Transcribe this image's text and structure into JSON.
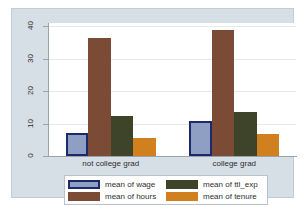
{
  "chart_data": {
    "type": "bar",
    "title": "",
    "subtitle": "",
    "xlabel": "",
    "ylabel": "",
    "categories": [
      "not college grad",
      "college grad"
    ],
    "series": [
      {
        "name": "mean of wage",
        "values": [
          7.0,
          10.8
        ],
        "color": "#8f9fc4",
        "border_color": "#1c2a6b"
      },
      {
        "name": "mean of hours",
        "values": [
          36.5,
          38.7
        ],
        "color": "#7b4b35",
        "border_color": "#7b4b35"
      },
      {
        "name": "mean of ttl_exp",
        "values": [
          12.2,
          13.5
        ],
        "color": "#3e4429",
        "border_color": "#3e4429"
      },
      {
        "name": "mean of tenure",
        "values": [
          5.6,
          6.7
        ],
        "color": "#d1801f",
        "border_color": "#d1801f"
      }
    ],
    "ylim": [
      0,
      41
    ],
    "yticks": [
      0,
      10,
      20,
      30,
      40
    ],
    "ytick_labels": [
      "0",
      "10",
      "20",
      "30",
      "40"
    ],
    "grid": true,
    "legend_position": "bottom",
    "background_color": "#d6dee6",
    "plot_background_color": "#ffffff"
  }
}
